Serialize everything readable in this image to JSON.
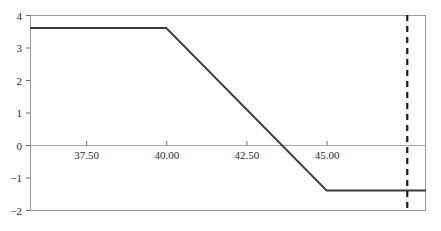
{
  "chart_data": {
    "type": "line",
    "title": "",
    "subtitle": "",
    "xlabel": "",
    "ylabel": "",
    "xlim": [
      35.75,
      48.1
    ],
    "ylim": [
      -2,
      4
    ],
    "grid": false,
    "legend": null,
    "axis": {
      "y_ticks": [
        {
          "value": 4,
          "label": "4"
        },
        {
          "value": 3,
          "label": "3"
        },
        {
          "value": 2,
          "label": "2"
        },
        {
          "value": 1,
          "label": "1"
        },
        {
          "value": 0,
          "label": "0"
        },
        {
          "value": -1,
          "label": "−1"
        },
        {
          "value": -2,
          "label": "−2"
        }
      ],
      "x_ticks": [
        {
          "value": 37.5,
          "label": "37.50"
        },
        {
          "value": 40.0,
          "label": "40.00"
        },
        {
          "value": 42.5,
          "label": "42.50"
        },
        {
          "value": 45.0,
          "label": "45.00"
        }
      ]
    },
    "series": [
      {
        "name": "payoff",
        "color": "#3b3b3b",
        "style": "solid",
        "width": 1.8,
        "points": [
          {
            "x": 35.75,
            "y": 3.6
          },
          {
            "x": 40.0,
            "y": 3.6
          },
          {
            "x": 45.0,
            "y": -1.4
          },
          {
            "x": 48.1,
            "y": -1.4
          }
        ]
      }
    ],
    "annotations": [
      {
        "type": "vline",
        "name": "reference-vertical-line",
        "x": 47.5,
        "style": "dashed",
        "color": "#1a1a1a",
        "width": 2.2
      },
      {
        "type": "hline",
        "name": "zero-baseline",
        "y": 0,
        "style": "solid",
        "color": "#a8a8a8",
        "width": 1
      },
      {
        "type": "hline",
        "name": "top-gridline",
        "y": 4,
        "style": "solid",
        "color": "#b5b5b5",
        "width": 1
      },
      {
        "type": "hline",
        "name": "bottom-axis-line",
        "y": -2,
        "style": "solid",
        "color": "#9a9a9a",
        "width": 1
      }
    ],
    "frame": {
      "left_spine": true,
      "right_spine": true,
      "top_spine": true,
      "bottom_spine": true,
      "color": "#9a9a9a"
    },
    "zero_crossing_x": 43.9
  }
}
